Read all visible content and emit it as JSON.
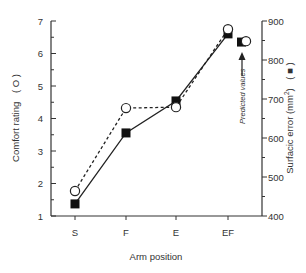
{
  "chart_data": {
    "type": "line",
    "title": "",
    "xlabel": "Arm position",
    "ylabel_left": "Comfort rating",
    "ylabel_left_marker": "( O )",
    "ylabel_right": "Surfacic error (mm²)",
    "ylabel_right_marker": "( ■ )",
    "categories": [
      "S",
      "F",
      "E",
      "EF"
    ],
    "ylim_left": [
      1,
      7
    ],
    "yticks_left": [
      1,
      2,
      3,
      4,
      5,
      6,
      7
    ],
    "ylim_right": [
      400,
      900
    ],
    "yticks_right": [
      400,
      500,
      600,
      700,
      800,
      900
    ],
    "grid": false,
    "series": [
      {
        "name": "Comfort rating",
        "axis": "left",
        "marker": "open-circle",
        "line": "dashed",
        "values": [
          1.77,
          4.32,
          4.35,
          6.75
        ],
        "predicted": 6.38
      },
      {
        "name": "Surfacic error",
        "axis": "right",
        "marker": "filled-square",
        "line": "solid",
        "values": [
          431,
          613,
          695,
          867
        ],
        "predicted": 846
      }
    ],
    "annotations": [
      {
        "text": "Predicted values",
        "position": "right of EF, with upward arrow"
      }
    ]
  },
  "labels": {
    "xlabel": "Arm position",
    "ylabel_left": "Comfort rating",
    "ylabel_left_marker": "( O )",
    "ylabel_right": "Surfacic error (mm",
    "ylabel_right_sup": "2",
    "ylabel_right_end": ")",
    "ylabel_right_marker": "( ■ )",
    "predicted": "Predicted values",
    "xticks": [
      "S",
      "F",
      "E",
      "EF"
    ],
    "yticks_left": [
      "1",
      "2",
      "3",
      "4",
      "5",
      "6",
      "7"
    ],
    "yticks_right": [
      "400",
      "500",
      "600",
      "700",
      "800",
      "900"
    ]
  }
}
